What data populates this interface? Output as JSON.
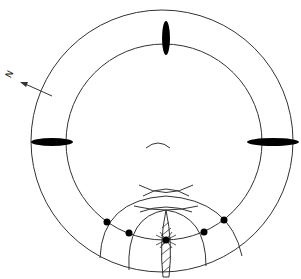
{
  "diagram": {
    "type": "concentric-rings-schematic",
    "north_label": "N",
    "colors": {
      "stroke": "#333333",
      "fill": "#000000",
      "background": "#ffffff"
    },
    "outer_circle": {
      "cx": 162,
      "cy": 141,
      "r": 131
    },
    "inner_circle": {
      "cx": 164,
      "cy": 142,
      "r": 98
    },
    "markers": [
      {
        "name": "top-marker",
        "cx": 166,
        "cy": 38,
        "rx": 4,
        "ry": 17
      },
      {
        "name": "left-marker",
        "cx": 52,
        "cy": 142,
        "rx": 21,
        "ry": 4
      },
      {
        "name": "right-marker",
        "cx": 273,
        "cy": 142,
        "rx": 26,
        "ry": 4
      }
    ],
    "dots": [
      {
        "cx": 107,
        "cy": 222
      },
      {
        "cx": 129,
        "cy": 233
      },
      {
        "cx": 166,
        "cy": 240
      },
      {
        "cx": 204,
        "cy": 232
      },
      {
        "cx": 224,
        "cy": 220
      }
    ]
  }
}
